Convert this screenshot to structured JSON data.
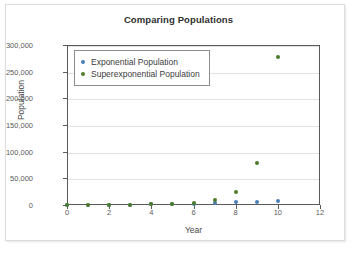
{
  "chart_data": {
    "type": "scatter",
    "title": "Comparing Populations",
    "xlabel": "Year",
    "ylabel": "Population",
    "xlim": [
      0,
      12
    ],
    "ylim": [
      0,
      300000
    ],
    "xticks": [
      "0",
      "2",
      "4",
      "6",
      "8",
      "10",
      "12"
    ],
    "xtick_values": [
      0,
      2,
      4,
      6,
      8,
      10,
      12
    ],
    "yticks": [
      "0",
      "50,000",
      "100,000",
      "150,000",
      "200,000",
      "250,000",
      "300,000"
    ],
    "ytick_values": [
      0,
      50000,
      100000,
      150000,
      200000,
      250000,
      300000
    ],
    "grid": true,
    "legend_position": "upper left",
    "x": [
      0,
      1,
      2,
      3,
      4,
      5,
      6,
      7,
      8,
      9,
      10
    ],
    "series": [
      {
        "name": "Exponential Population",
        "color": "#4a7fb5",
        "values": [
          100,
          200,
          400,
          700,
          1200,
          1900,
          2800,
          3800,
          4800,
          5800,
          7000
        ]
      },
      {
        "name": "Superexponential Population",
        "color": "#4f7c2a",
        "values": [
          100,
          300,
          500,
          800,
          1300,
          2100,
          4000,
          10000,
          25000,
          78000,
          277000
        ]
      }
    ]
  },
  "legend": {
    "items": [
      {
        "label": "Exponential Population",
        "color": "#4a7fb5"
      },
      {
        "label": "Superexponential Population",
        "color": "#4f7c2a"
      }
    ]
  }
}
